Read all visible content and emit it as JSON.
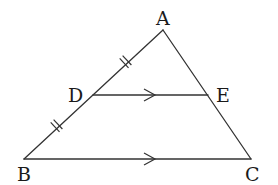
{
  "diagram": {
    "title": "",
    "type": "triangle-midsegment",
    "points": {
      "A": {
        "label": "A",
        "x": 163,
        "y": 30
      },
      "B": {
        "label": "B",
        "x": 24,
        "y": 159
      },
      "C": {
        "label": "C",
        "x": 251,
        "y": 159
      },
      "D": {
        "label": "D",
        "x": 93,
        "y": 95
      },
      "E": {
        "label": "E",
        "x": 208,
        "y": 95
      }
    },
    "segments": [
      {
        "from": "A",
        "to": "B"
      },
      {
        "from": "A",
        "to": "C"
      },
      {
        "from": "B",
        "to": "C",
        "marker": "parallel-arrow"
      },
      {
        "from": "D",
        "to": "E",
        "marker": "parallel-arrow"
      }
    ],
    "equal_marks": [
      {
        "segment": "AD",
        "ticks": 2
      },
      {
        "segment": "DB",
        "ticks": 2
      }
    ],
    "relations": [
      "AD = DB",
      "DE ∥ BC"
    ],
    "colors": {
      "line": "#333333",
      "text": "#1a1a1a",
      "background": "#ffffff"
    }
  }
}
